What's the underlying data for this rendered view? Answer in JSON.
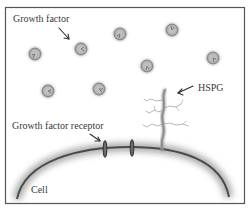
{
  "diagram": {
    "labels": {
      "growth_factor": "Growth factor",
      "hspg": "HSPG",
      "growth_factor_receptor": "Growth factor receptor",
      "cell": "Cell"
    },
    "colors": {
      "frame": "#555555",
      "membrane": "#4a4a4a",
      "membrane_glow": "#b0b0b0",
      "growth_factor_fill": "#bdbdbd",
      "growth_factor_edge": "#8a8a8a",
      "hspg": "#9a9a9a",
      "receptor": "#3c3c3c",
      "text": "#3a3a3a"
    },
    "growth_factors": [
      {
        "x": 35,
        "y": 54
      },
      {
        "x": 81,
        "y": 49
      },
      {
        "x": 120,
        "y": 34
      },
      {
        "x": 172,
        "y": 30
      },
      {
        "x": 147,
        "y": 66
      },
      {
        "x": 213,
        "y": 58
      },
      {
        "x": 48,
        "y": 91
      },
      {
        "x": 99,
        "y": 89
      }
    ],
    "receptors": [
      {
        "x": 105,
        "y": 149
      },
      {
        "x": 132,
        "y": 148
      }
    ]
  }
}
